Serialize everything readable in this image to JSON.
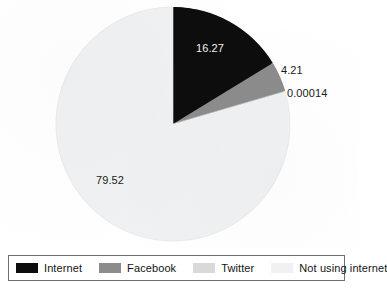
{
  "chart_data": {
    "type": "pie",
    "title": "",
    "subtitle": "",
    "xlabel": "",
    "ylabel": "",
    "legend_position": "bottom",
    "grid": false,
    "categories": [
      "Internet",
      "Facebook",
      "Twitter",
      "Not using internet"
    ],
    "values": [
      16.27,
      4.21,
      0.00014,
      79.52
    ],
    "value_labels": [
      "16.27",
      "4.21",
      "0.00014",
      "79.52"
    ],
    "colors": [
      "#0d0d0d",
      "#8c8c8c",
      "#d9d9d9",
      "#f0f1f2"
    ],
    "slices": [
      {
        "name": "Internet",
        "value": 16.27,
        "label": "16.27",
        "color": "#0d0d0d"
      },
      {
        "name": "Facebook",
        "value": 4.21,
        "label": "4.21",
        "color": "#8c8c8c"
      },
      {
        "name": "Twitter",
        "value": 0.00014,
        "label": "0.00014",
        "color": "#d9d9d9"
      },
      {
        "name": "Not using internet",
        "value": 79.52,
        "label": "79.52",
        "color": "#f0f1f2"
      }
    ],
    "start_angle_deg": 0,
    "direction": "clockwise",
    "total": 100.00014
  },
  "legend": {
    "items": [
      {
        "label": "Internet",
        "color": "#0d0d0d"
      },
      {
        "label": "Facebook",
        "color": "#8c8c8c"
      },
      {
        "label": "Twitter",
        "color": "#d9d9d9"
      },
      {
        "label": "Not using internet",
        "color": "#f0f1f2"
      }
    ]
  }
}
